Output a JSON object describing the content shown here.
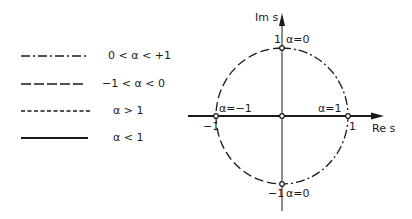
{
  "legend": {
    "items": [
      {
        "label": "0 < α < +1",
        "style": "dash-dot"
      },
      {
        "label": "−1 < α < 0",
        "style": "long-dash"
      },
      {
        "label": "α > 1",
        "style": "short-dash"
      },
      {
        "label": "α < 1",
        "style": "solid"
      }
    ]
  },
  "plot": {
    "y_axis_label": "Im s",
    "x_axis_label": "Re s",
    "points": {
      "top": {
        "tick": "1",
        "annotation": "α=0"
      },
      "bottom": {
        "tick": "−1",
        "annotation": "α=0"
      },
      "left": {
        "tick": "−1",
        "annotation": "α=−1"
      },
      "right": {
        "tick": "1",
        "annotation": "α=1"
      }
    },
    "colors": {
      "stroke": "#1a1a1a",
      "background": "#ffffff"
    }
  }
}
